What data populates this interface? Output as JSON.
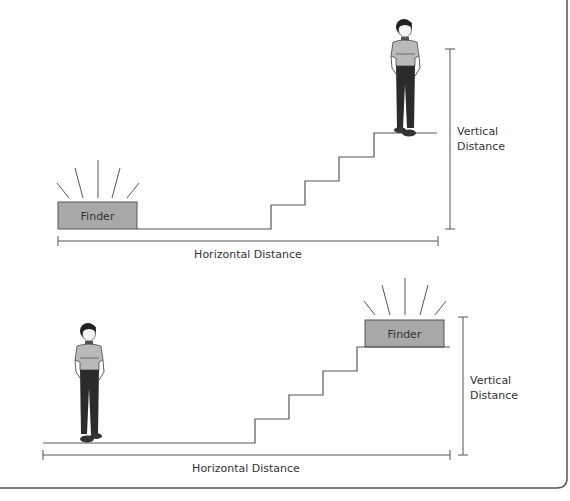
{
  "colors": {
    "line": "#555555",
    "finder_fill": "#a8a8a8",
    "finder_stroke": "#555555",
    "shirt": "#b9b9b9",
    "pants": "#2b2b2b",
    "hair": "#222222",
    "skin": "#f4f4f4",
    "border": "#555555"
  },
  "panels": [
    {
      "id": "top",
      "finder_label": "Finder",
      "finder_position": "bottom-left",
      "person_position": "top-of-stairs",
      "vertical_label_line1": "Vertical",
      "vertical_label_line2": "Distance",
      "horizontal_label": "Horizontal Distance",
      "steps": 4
    },
    {
      "id": "bottom",
      "finder_label": "Finder",
      "finder_position": "top-of-stairs",
      "person_position": "bottom-left",
      "vertical_label_line1": "Vertical",
      "vertical_label_line2": "Distance",
      "horizontal_label": "Horizontal Distance",
      "steps": 4
    }
  ]
}
